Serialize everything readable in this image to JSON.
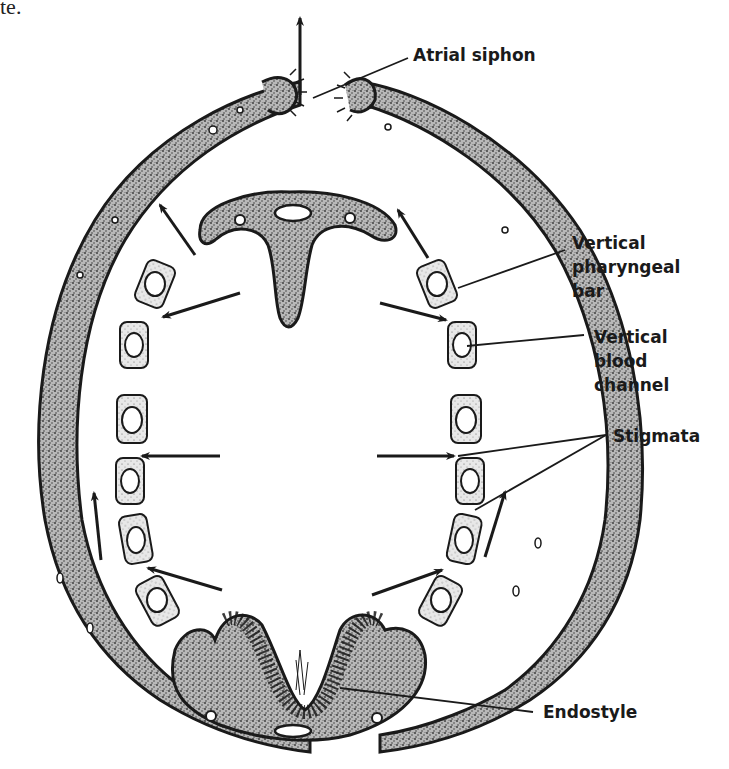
{
  "page_fragment": "te.",
  "diagram": {
    "labels": {
      "atrial_siphon": "Atrial siphon",
      "vertical_pharyngeal_bar": [
        "Vertical",
        "pharyngeal",
        "bar"
      ],
      "vertical_blood_channel": [
        "Vertical",
        "blood",
        "channel"
      ],
      "stigmata": "Stigmata",
      "endostyle": "Endostyle"
    },
    "colors": {
      "ink": "#1a1a1a",
      "tissue_fill": "#9a9a9a",
      "background": "#ffffff"
    }
  }
}
